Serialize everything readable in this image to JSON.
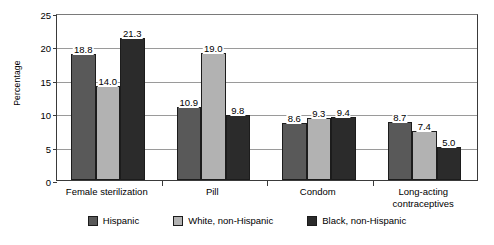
{
  "chart_data": {
    "type": "bar",
    "title": "",
    "subtitle": "",
    "xlabel": "",
    "ylabel": "Percentage",
    "ylim": [
      0,
      25
    ],
    "yticks": [
      0,
      5,
      10,
      15,
      20,
      25
    ],
    "ytick_labels": [
      "0",
      "5",
      "10",
      "15",
      "20",
      "25"
    ],
    "grid": "horizontal",
    "legend_position": "bottom",
    "categories": [
      "Female sterilization",
      "Pill",
      "Condom",
      "Long-acting contraceptives"
    ],
    "category_lines": [
      [
        "Female sterilization"
      ],
      [
        "Pill"
      ],
      [
        "Condom"
      ],
      [
        "Long-acting",
        "contraceptives"
      ]
    ],
    "series": [
      {
        "name": "Hispanic",
        "color": "#595959",
        "values": [
          18.8,
          10.9,
          8.6,
          8.7
        ],
        "labels": [
          "18.8",
          "10.9",
          "8.6",
          "8.7"
        ]
      },
      {
        "name": "White, non-Hispanic",
        "color": "#b2b2b2",
        "values": [
          14.0,
          19.0,
          9.3,
          7.4
        ],
        "labels": [
          "14.0",
          "19.0",
          "9.3",
          "7.4"
        ]
      },
      {
        "name": "Black, non-Hispanic",
        "color": "#2b2b2b",
        "values": [
          21.3,
          9.8,
          9.4,
          5.0
        ],
        "labels": [
          "21.3",
          "9.8",
          "9.4",
          "5.0"
        ]
      }
    ]
  }
}
